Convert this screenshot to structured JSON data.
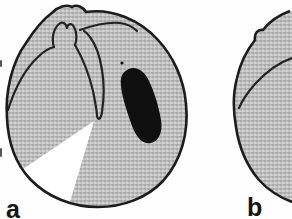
{
  "figure": {
    "panels": [
      {
        "id": "panel-a",
        "label": "a"
      },
      {
        "id": "panel-b",
        "label": "b"
      }
    ],
    "colors": {
      "background": "#fefefe",
      "tissue_gray": "#c0c0c0",
      "outline": "#1c1c1c",
      "inner_line": "#222222",
      "lesion": "#101010",
      "wedge_white": "#ffffff",
      "label_color": "#161616"
    }
  }
}
